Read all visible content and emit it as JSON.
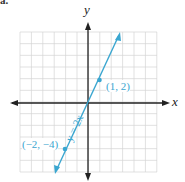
{
  "part_label": "a.",
  "chart_data": {
    "type": "line",
    "title": "",
    "xlabel": "x",
    "ylabel": "y",
    "xlim": [
      -6,
      6
    ],
    "ylim": [
      -6,
      6
    ],
    "grid": true,
    "series": [
      {
        "name": "y = 2x",
        "equation": "y = 2x",
        "x": [
          -3,
          3
        ],
        "y": [
          -6,
          6
        ],
        "color": "#3aa6d0"
      }
    ],
    "points": [
      {
        "x": 1,
        "y": 2,
        "label": "(1, 2)"
      },
      {
        "x": -2,
        "y": -4,
        "label": "(−2, −4)"
      }
    ],
    "annotations": [
      "y = 2x",
      "(1, 2)",
      "(−2, −4)"
    ]
  }
}
